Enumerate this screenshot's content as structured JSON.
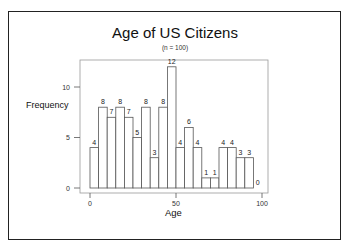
{
  "chart": {
    "title": "Age of US Citizens",
    "subtitle": "(n = 100)",
    "xlabel": "Age",
    "ylabel": "Frequency"
  },
  "chart_data": {
    "type": "bar",
    "title": "Age of US Citizens",
    "subtitle": "(n = 100)",
    "xlabel": "Age",
    "ylabel": "Frequency",
    "bin_width": 5,
    "bin_edges": [
      0,
      5,
      10,
      15,
      20,
      25,
      30,
      35,
      40,
      45,
      50,
      55,
      60,
      65,
      70,
      75,
      80,
      85,
      90,
      95,
      100
    ],
    "categories": [
      "0-5",
      "5-10",
      "10-15",
      "15-20",
      "20-25",
      "25-30",
      "30-35",
      "35-40",
      "40-45",
      "45-50",
      "50-55",
      "55-60",
      "60-65",
      "65-70",
      "70-75",
      "75-80",
      "80-85",
      "85-90",
      "90-95",
      "95-100"
    ],
    "values": [
      4,
      8,
      7,
      8,
      7,
      5,
      8,
      3,
      8,
      12,
      4,
      6,
      4,
      1,
      1,
      4,
      4,
      3,
      3,
      0
    ],
    "xlim": [
      0,
      100
    ],
    "ylim": [
      0,
      12
    ],
    "xticks": [
      0,
      50,
      100
    ],
    "yticks": [
      0,
      5,
      10
    ],
    "data_labels": true,
    "grid": false,
    "legend": null
  }
}
